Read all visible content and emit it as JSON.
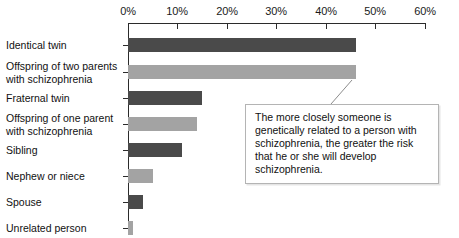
{
  "chart_data": {
    "type": "bar",
    "orientation": "horizontal",
    "title": "",
    "xlabel": "",
    "ylabel": "",
    "xlim": [
      0,
      60
    ],
    "xticks": [
      0,
      10,
      20,
      30,
      40,
      50,
      60
    ],
    "xtick_labels": [
      "0%",
      "10%",
      "20%",
      "30%",
      "40%",
      "50%",
      "60%"
    ],
    "grid": false,
    "legend": null,
    "categories": [
      "Identical twin",
      "Offspring of two parents with schizophrenia",
      "Fraternal twin",
      "Offspring of one parent with schizophrenia",
      "Sibling",
      "Nephew or niece",
      "Spouse",
      "Unrelated person"
    ],
    "values": [
      46,
      46,
      15,
      14,
      11,
      5,
      3,
      1
    ],
    "bar_colors": [
      "#4a4a4a",
      "#a3a3a3",
      "#4a4a4a",
      "#a3a3a3",
      "#4a4a4a",
      "#a3a3a3",
      "#4a4a4a",
      "#a3a3a3"
    ],
    "annotations": [
      {
        "text": "The more closely someone is genetically related to a person with schizophrenia, the greater the risk that he or she will develop schizophrenia.",
        "points_to": "Offspring of two parents with schizophrenia"
      }
    ]
  },
  "labels": {
    "c0": "Identical twin",
    "c1_line1": "Offspring of two parents",
    "c1_line2": "with schizophrenia",
    "c2": "Fraternal twin",
    "c3_line1": "Offspring of one parent",
    "c3_line2": "with schizophrenia",
    "c4": "Sibling",
    "c5": "Nephew or niece",
    "c6": "Spouse",
    "c7": "Unrelated person"
  },
  "ticks": {
    "t0": "0%",
    "t1": "10%",
    "t2": "20%",
    "t3": "30%",
    "t4": "40%",
    "t5": "50%",
    "t6": "60%"
  },
  "callout": {
    "line1": "The more closely someone is genetically",
    "line2": "related to a person with schizophrenia,",
    "line3": "the greater the risk that he or she will",
    "line4": "develop schizophrenia."
  },
  "colors": {
    "bar_dark": "#4a4a4a",
    "bar_light": "#a3a3a3",
    "axis": "#2b2b2b",
    "callout_border": "#b4b4b4",
    "text": "#111111",
    "background": "#ffffff"
  }
}
